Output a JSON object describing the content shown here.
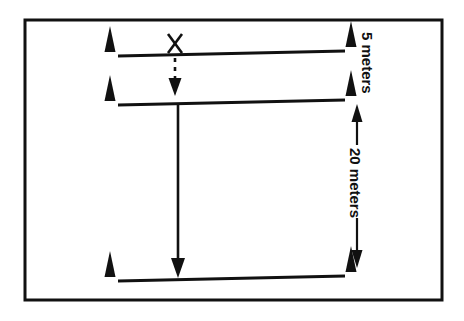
{
  "diagram": {
    "background_color": "#ffffff",
    "stroke_color": "#111111",
    "border": {
      "name": "outer-frame",
      "x": 25,
      "y": 20,
      "width": 417,
      "height": 280,
      "stroke_width": 3
    },
    "lines": [
      {
        "name": "start-line",
        "label": "top line",
        "x1": 118,
        "y1": 56,
        "x2": 345,
        "y2": 51
      },
      {
        "name": "second-line",
        "label": "middle line",
        "x1": 118,
        "y1": 105,
        "x2": 345,
        "y2": 100
      },
      {
        "name": "finish-line",
        "label": "bottom line",
        "x1": 118,
        "y1": 281,
        "x2": 345,
        "y2": 276
      }
    ],
    "cones": [
      {
        "name": "cone-top-left",
        "x": 110,
        "y": 52
      },
      {
        "name": "cone-top-right",
        "x": 351,
        "y": 47
      },
      {
        "name": "cone-middle-left",
        "x": 110,
        "y": 101
      },
      {
        "name": "cone-middle-right",
        "x": 351,
        "y": 96
      },
      {
        "name": "cone-bottom-left",
        "x": 110,
        "y": 277
      },
      {
        "name": "cone-bottom-right",
        "x": 351,
        "y": 272
      }
    ],
    "marker_x": {
      "name": "start-position-marker",
      "text": "X",
      "x": 175,
      "y": 44
    },
    "dashed_arrow": {
      "name": "dashed-approach-arrow",
      "x": 175,
      "y_start": 57,
      "y_end": 95,
      "dash_pattern": "4,5"
    },
    "solid_arrow": {
      "name": "solid-run-arrow",
      "x": 178,
      "y_start": 106,
      "y_end": 275
    },
    "measurements": [
      {
        "name": "measure-5-meters",
        "label": "5 meters",
        "value": 5,
        "unit": "meters",
        "label_x": 375,
        "label_y": 33,
        "rotation": 90,
        "has_arrow": false
      },
      {
        "name": "measure-20-meters",
        "label": "20 meters",
        "value": 20,
        "unit": "meters",
        "label_x": 375,
        "label_y": 153,
        "rotation": 90,
        "has_arrow": true,
        "arrow_x": 357,
        "arrow_y_top": 106,
        "arrow_y_bottom": 268,
        "gap_top": 142,
        "gap_bottom": 222
      }
    ]
  }
}
